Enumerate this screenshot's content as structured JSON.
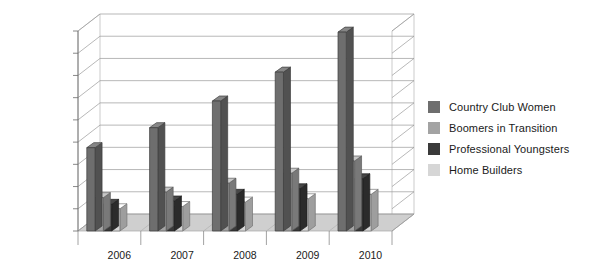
{
  "chart_data": {
    "type": "bar",
    "title": "",
    "subtitle": "",
    "xlabel": "",
    "ylabel": "",
    "categories": [
      "2006",
      "2007",
      "2008",
      "2009",
      "2010"
    ],
    "series": [
      {
        "name": "Country Club Women",
        "color": "#6e6e6e",
        "values": [
          75000,
          93000,
          117000,
          143000,
          179000
        ]
      },
      {
        "name": "Boomers in Transition",
        "color": "#a3a3a3",
        "values": [
          30000,
          35000,
          43000,
          52000,
          63000
        ]
      },
      {
        "name": "Professional Youngsters",
        "color": "#3a3a3a",
        "values": [
          24000,
          27000,
          33000,
          38000,
          47000
        ]
      },
      {
        "name": "Home Builders",
        "color": "#d6d6d6",
        "values": [
          20000,
          22000,
          26000,
          29000,
          33000
        ]
      }
    ],
    "ylim": [
      0,
      180000
    ],
    "ytick_step": 20000,
    "ytick_labels": [
      "0",
      "20,000",
      "40,000",
      "60,000",
      "80,000",
      "100,000",
      "120,000",
      "140,000",
      "160,000",
      "180,000"
    ],
    "grid": true,
    "grid_axis": "y",
    "legend_position": "right",
    "style": "3d-grouped-column",
    "colors": {
      "plot_background": "#ffffff",
      "grid_line": "#9a9a9a",
      "axis_line": "#6b6b6b",
      "floor": "#cfcfcf",
      "wall": "#ffffff",
      "text": "#1a1a1a"
    }
  },
  "legend": {
    "items": [
      {
        "label": "Country Club Women"
      },
      {
        "label": "Boomers in Transition"
      },
      {
        "label": "Professional Youngsters"
      },
      {
        "label": "Home Builders"
      }
    ]
  }
}
